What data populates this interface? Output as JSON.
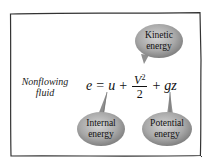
{
  "diagram": {
    "side_label": {
      "line1": "Nonflowing",
      "line2": "fluid"
    },
    "equation": {
      "lhs": "e",
      "equals": "=",
      "term_internal": "u",
      "plus1": "+",
      "kinetic_numerator": "V",
      "kinetic_exponent": "2",
      "kinetic_denominator": "2",
      "plus2": "+",
      "term_potential_g": "g",
      "term_potential_z": "z"
    },
    "callouts": [
      {
        "id": "kinetic",
        "line1": "Kinetic",
        "line2": "energy",
        "points_to": "V^2/2"
      },
      {
        "id": "internal",
        "line1": "Internal",
        "line2": "energy",
        "points_to": "u"
      },
      {
        "id": "potential",
        "line1": "Potential",
        "line2": "energy",
        "points_to": "gz"
      }
    ],
    "colors": {
      "bubble_fill_light": "#cfcfcf",
      "bubble_fill_dark": "#8a8a8a",
      "frame_stroke": "#333333",
      "text": "#111111"
    }
  }
}
